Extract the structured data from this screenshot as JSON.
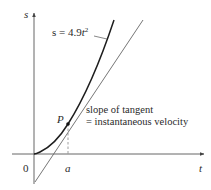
{
  "diagram": {
    "axes": {
      "vertical_label": "s",
      "horizontal_label": "t",
      "origin_label": "0"
    },
    "curve": {
      "equation_prefix": "s = 4.9",
      "equation_var": "t",
      "equation_exp": "2"
    },
    "point": {
      "label": "P",
      "x_label": "a"
    },
    "annotation": {
      "line1": "slope of tangent",
      "line2": "= instantaneous velocity"
    },
    "colors": {
      "curve": "#222222",
      "tangent": "#555555",
      "axes": "#444444",
      "text": "#2a2a2a"
    }
  }
}
